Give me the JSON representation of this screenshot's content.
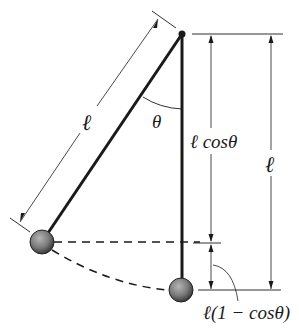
{
  "diagram": {
    "labels": {
      "length_slanted": "ℓ",
      "angle": "θ",
      "vertical_component": "ℓ cosθ",
      "length_vertical": "ℓ",
      "height_rise": "ℓ(1 − cosθ)"
    },
    "colors": {
      "line": "#1a1a1a",
      "bob_light": "#9a9a9a",
      "bob_dark": "#3a3a3a"
    },
    "geometry": {
      "pivot": [
        182,
        34
      ],
      "bob_displaced": [
        42,
        242
      ],
      "bob_rest": [
        181,
        290
      ],
      "bob_radius": 12
    }
  }
}
